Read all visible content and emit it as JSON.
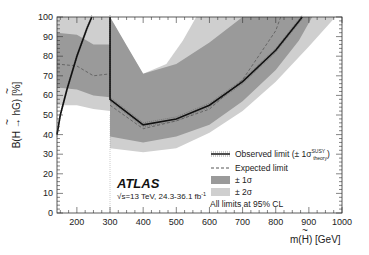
{
  "chart_data": {
    "type": "line",
    "title": "",
    "xlabel": "m(H~) [GeV]",
    "ylabel": "B(H~ → hG~) [%]",
    "xlim": [
      140,
      1000
    ],
    "ylim": [
      0,
      100
    ],
    "x_ticks": [
      200,
      300,
      400,
      500,
      600,
      700,
      800,
      900,
      1000
    ],
    "y_ticks": [
      0,
      10,
      20,
      30,
      40,
      50,
      60,
      70,
      80,
      90,
      100
    ],
    "grid": false,
    "legend_position": "lower right inside",
    "segments_note": "Two analysis regions: m < 300 GeV and m >= 300 GeV, separated by a vertical line at 300 GeV",
    "series": [
      {
        "name": "Observed limit (± 1σ theory SUSY)",
        "style": "solid-black-thick",
        "regions": [
          {
            "x": [
              140,
              150,
              170,
              200,
              230,
              245
            ],
            "y": [
              40,
              50,
              63,
              80,
              94,
              100
            ]
          },
          {
            "x": [
              300,
              300,
              400,
              500,
              600,
              700,
              800,
              880
            ],
            "y": [
              100,
              58,
              45,
              48,
              55,
              67,
              83,
              100
            ]
          }
        ]
      },
      {
        "name": "Expected limit",
        "style": "dashed-gray",
        "regions": [
          {
            "x": [
              140,
              200,
              250,
              300
            ],
            "y": [
              76,
              75,
              70,
              71
            ]
          },
          {
            "x": [
              300,
              400,
              500,
              600,
              700,
              800,
              815
            ],
            "y": [
              55,
              43,
              47,
              53,
              68,
              93,
              100
            ]
          }
        ]
      },
      {
        "name": "± 1σ",
        "style": "band-dark-gray",
        "regions": [
          {
            "x": [
              140,
              200,
              250,
              300
            ],
            "upper": [
              92,
              91,
              86,
              86
            ],
            "lower": [
              64,
              63,
              60,
              59
            ]
          },
          {
            "x": [
              300,
              400,
              500,
              600,
              700,
              800,
              870,
              910
            ],
            "upper": [
              100,
              71,
              76,
              87,
              100,
              100,
              100,
              100
            ],
            "lower": [
              39,
              36,
              39,
              45,
              57,
              73,
              88,
              100
            ]
          }
        ]
      },
      {
        "name": "± 2σ",
        "style": "band-light-gray",
        "regions": [
          {
            "x": [
              140,
              200,
              250,
              300
            ],
            "upper": [
              100,
              100,
              100,
              100
            ],
            "lower": [
              55,
              55,
              53,
              52
            ]
          },
          {
            "x": [
              300,
              400,
              500,
              550,
              600,
              700,
              800,
              900,
              980
            ],
            "upper": [
              100,
              100,
              100,
              100,
              100,
              100,
              100,
              100,
              100
            ],
            "lower": [
              33,
              31,
              33,
              37,
              41,
              52,
              67,
              85,
              100
            ]
          }
        ]
      }
    ],
    "band_holes": [
      {
        "note": "2σ band inner upper edge (region above is white) for m>=300",
        "x": [
          300,
          350,
          400,
          470,
          520,
          560
        ],
        "y": [
          100,
          85,
          71,
          76,
          88,
          100
        ]
      }
    ],
    "annotations": [
      "ATLAS",
      "√s=13 TeV, 24.3-36.1 fb⁻¹",
      "All limits at 95% CL"
    ]
  },
  "axes": {
    "y_title_main": "B(",
    "y_title_H": "H",
    "y_title_arrow": " → h",
    "y_title_G": "G",
    "y_title_end": ") [%]",
    "x_title_pre": "m(",
    "x_title_H": "H",
    "x_title_post": ")  [GeV]",
    "x_tick_labels": [
      "200",
      "300",
      "400",
      "500",
      "600",
      "700",
      "800",
      "900",
      "1000"
    ],
    "y_tick_labels": [
      "0",
      "10",
      "20",
      "30",
      "40",
      "50",
      "60",
      "70",
      "80",
      "90",
      "100"
    ]
  },
  "legend": {
    "observed": "Observed limit (± 1σ",
    "observed_sup": "SUSY",
    "observed_sub": "theory",
    "observed_close": ")",
    "expected": "Expected limit",
    "one_sigma": "± 1σ",
    "two_sigma": "± 2σ",
    "cl_note": "All limits at 95% CL"
  },
  "labels": {
    "experiment": "ATLAS",
    "energy_pre": "√s=13 TeV, 24.3-36.1 fb",
    "energy_sup": "-1"
  },
  "colors": {
    "two_sigma": "#cfcfcf",
    "one_sigma": "#9a9a9a",
    "observed": "#111111",
    "expected": "#666666"
  }
}
